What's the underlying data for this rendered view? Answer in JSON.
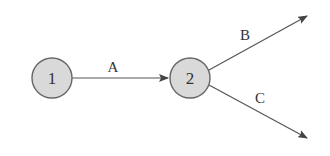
{
  "diagram": {
    "type": "directed-graph",
    "nodes": [
      {
        "id": "1",
        "label": "1",
        "cx": 52,
        "cy": 78,
        "r": 20
      },
      {
        "id": "2",
        "label": "2",
        "cx": 190,
        "cy": 78,
        "r": 20
      }
    ],
    "edges": [
      {
        "label": "A",
        "from": "1",
        "to": "2"
      },
      {
        "label": "B",
        "from": "2",
        "to": null
      },
      {
        "label": "C",
        "from": "2",
        "to": null
      }
    ],
    "colors": {
      "node_fill": "#d9d9d9",
      "node_stroke": "#666666",
      "edge": "#555555"
    }
  }
}
